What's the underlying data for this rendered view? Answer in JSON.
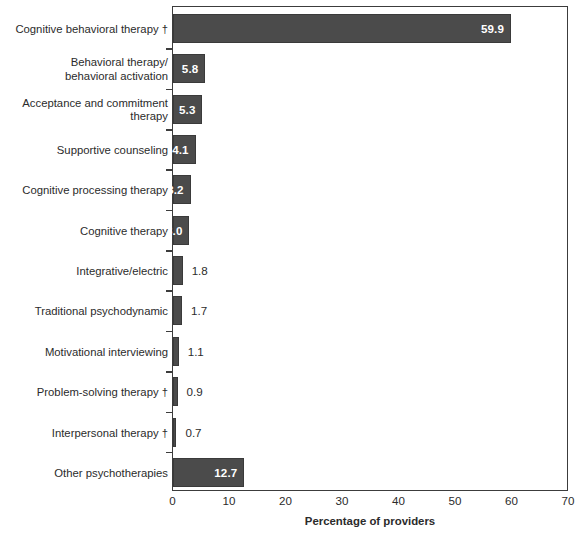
{
  "chart_data": {
    "type": "bar",
    "orientation": "horizontal",
    "title": "",
    "xlabel": "Percentage of providers",
    "ylabel": "",
    "xlim": [
      0,
      70
    ],
    "xticks": [
      0,
      10,
      20,
      30,
      40,
      50,
      60,
      70
    ],
    "grid": false,
    "legend": null,
    "bar_color": "#4b4b4b",
    "categories": [
      "Cognitive behavioral therapy †",
      "Behavioral therapy/\nbehavioral activation",
      "Acceptance and commitment\ntherapy",
      "Supportive counseling",
      "Cognitive processing therapy",
      "Cognitive therapy",
      "Integrative/electric",
      "Traditional psychodynamic",
      "Motivational interviewing",
      "Problem-solving therapy †",
      "Interpersonal therapy †",
      "Other psychotherapies"
    ],
    "values": [
      59.9,
      5.8,
      5.3,
      4.1,
      3.2,
      3.0,
      1.8,
      1.7,
      1.1,
      0.9,
      0.7,
      12.7
    ],
    "value_labels": [
      "59.9",
      "5.8",
      "5.3",
      "4.1",
      "3.2",
      "3.0",
      "1.8",
      "1.7",
      "1.1",
      "0.9",
      "0.7",
      "12.7"
    ],
    "label_inside": [
      true,
      true,
      true,
      true,
      true,
      true,
      false,
      false,
      false,
      false,
      false,
      true
    ]
  },
  "axis": {
    "x_title": "Percentage of providers",
    "x_tick_labels": [
      "0",
      "10",
      "20",
      "30",
      "40",
      "50",
      "60",
      "70"
    ]
  }
}
